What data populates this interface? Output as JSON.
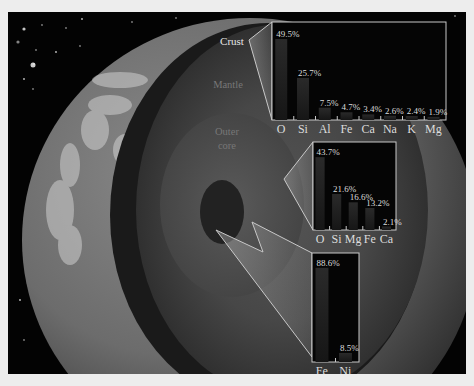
{
  "layers": {
    "crust_label": "Crust",
    "mantle_label": "Mantle",
    "outer_core_label_1": "Outer",
    "outer_core_label_2": "core"
  },
  "colors": {
    "frame": "#ededed",
    "space": "#030303",
    "box_border": "#c8c8c8",
    "bar": "#1e1e1e",
    "text": "#dcdcdc"
  },
  "chart_data": [
    {
      "type": "bar",
      "title": "Crust",
      "categories": [
        "O",
        "Si",
        "Al",
        "Fe",
        "Ca",
        "Na",
        "K",
        "Mg"
      ],
      "values": [
        49.5,
        25.7,
        7.5,
        4.7,
        3.4,
        2.6,
        2.4,
        1.9
      ],
      "labels": [
        "49.5%",
        "25.7%",
        "7.5%",
        "4.7%",
        "3.4%",
        "2.6%",
        "2.4%",
        "1.9%"
      ],
      "ylim": [
        0,
        55
      ],
      "unit": "%"
    },
    {
      "type": "bar",
      "title": "Mantle",
      "categories": [
        "O",
        "Si",
        "Mg",
        "Fe",
        "Ca"
      ],
      "values": [
        43.7,
        21.6,
        16.6,
        13.2,
        2.1
      ],
      "labels": [
        "43.7%",
        "21.6%",
        "16.6%",
        "13.2%",
        "2.1%"
      ],
      "ylim": [
        0,
        48
      ],
      "unit": "%"
    },
    {
      "type": "bar",
      "title": "Core",
      "categories": [
        "Fe",
        "Ni"
      ],
      "values": [
        88.6,
        8.5
      ],
      "labels": [
        "88.6%",
        "8.5%"
      ],
      "ylim": [
        0,
        95
      ],
      "unit": "%"
    }
  ]
}
